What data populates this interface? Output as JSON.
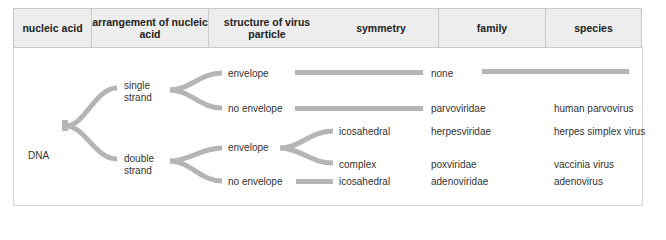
{
  "headers": [
    {
      "label": "nucleic acid"
    },
    {
      "label": "arrangement of nucleic acid"
    },
    {
      "label": "structure of virus particle"
    },
    {
      "label": "symmetry"
    },
    {
      "label": "family"
    },
    {
      "label": "species"
    }
  ],
  "tree": {
    "root": "DNA",
    "arrangement": {
      "single": "single strand",
      "double": "double strand"
    },
    "structure": {
      "ss_envelope": "envelope",
      "ss_no_envelope": "no envelope",
      "ds_envelope": "envelope",
      "ds_no_envelope": "no envelope"
    },
    "symmetry": {
      "ds_env_icosahedral": "icosahedral",
      "ds_env_complex": "complex",
      "ds_noenv_icosahedral": "icosahedral"
    }
  },
  "families": [
    "none",
    "parvoviridae",
    "herpesviridae",
    "poxviridae",
    "adenoviridae"
  ],
  "species": [
    "human parvovirus",
    "herpes simplex virus",
    "vaccinia virus",
    "adenovirus"
  ],
  "colors": {
    "branch": "#b5b5b5",
    "header_bg": "#ededed",
    "border": "#c9c9c9"
  }
}
